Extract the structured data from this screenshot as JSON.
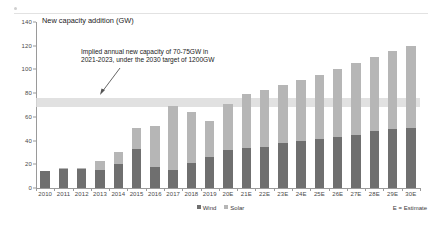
{
  "chart_data": {
    "type": "bar",
    "stacked": true,
    "title": "New capacity addition (GW)",
    "xlabel": "",
    "ylabel": "",
    "ylim": [
      0,
      140
    ],
    "yticks": [
      0,
      20,
      40,
      60,
      80,
      100,
      120,
      140
    ],
    "grid": false,
    "legend_position": "bottom-center",
    "categories": [
      "2010",
      "2011",
      "2012",
      "2013",
      "2014",
      "2015",
      "2016",
      "2017",
      "2018",
      "2019",
      "20E",
      "21E",
      "22E",
      "23E",
      "24E",
      "25E",
      "26E",
      "27E",
      "28E",
      "29E",
      "30E"
    ],
    "series": [
      {
        "name": "Wind",
        "color": "#6f6f6f",
        "values": [
          14,
          16,
          16,
          15,
          20.5,
          33,
          17.5,
          15,
          21,
          26,
          32,
          34,
          35,
          38,
          40,
          41,
          43,
          45,
          48,
          50,
          51
        ]
      },
      {
        "name": "Solar",
        "color": "#b6b6b6",
        "values": [
          0.5,
          0.8,
          0.5,
          8,
          9.5,
          18,
          34.5,
          54,
          43.5,
          30.5,
          38.5,
          45,
          48,
          49,
          51,
          54,
          57.5,
          60.5,
          62.5,
          65.5,
          68.5
        ]
      }
    ],
    "totals": [
      14.5,
      16.8,
      16.5,
      23,
      30,
      51,
      52,
      69,
      64.5,
      56.5,
      70.5,
      79,
      83,
      87,
      91,
      95,
      100.5,
      105.5,
      110.5,
      115.5,
      119.5
    ],
    "annotations": [
      {
        "name": "implied-capacity-note",
        "text": "Implied annual new capacity of 70-75GW in 2021-2023, under the 2030 target of 1200GW",
        "points_to": "highlight-band"
      }
    ],
    "highlight_band": {
      "name": "implied-capacity-band",
      "from": 68,
      "to": 76,
      "color": "#dcdcdc"
    },
    "footnote": "E = Estimate"
  },
  "chart": {
    "title": "New capacity addition (GW)",
    "annotation": "Implied annual new capacity of 70-75GW in 2021-2023, under the 2030 target of 1200GW",
    "footnote": "E = Estimate"
  },
  "legend": {
    "items": [
      {
        "label": "Wind",
        "color": "#6f6f6f"
      },
      {
        "label": "Solar",
        "color": "#b6b6b6"
      }
    ]
  },
  "colors": {
    "wind": "#6f6f6f",
    "solar": "#b6b6b6",
    "band": "#dcdcdc",
    "axis": "#9a9a9a",
    "text": "#222222"
  }
}
